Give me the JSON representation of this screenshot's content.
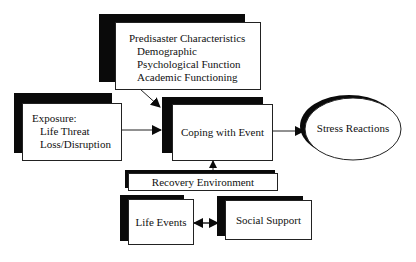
{
  "diagram": {
    "nodes": {
      "predisaster": {
        "title": "Predisaster Characteristics",
        "items": [
          "Demographic",
          "Psychological Function",
          "Academic Functioning"
        ]
      },
      "exposure": {
        "title": "Exposure:",
        "items": [
          "Life Threat",
          "Loss/Disruption"
        ]
      },
      "coping": {
        "label": "Coping with Event"
      },
      "stress": {
        "label": "Stress Reactions"
      },
      "recovery": {
        "label": "Recovery Environment"
      },
      "life_events": {
        "label": "Life Events"
      },
      "social_support": {
        "label": "Social Support"
      }
    },
    "edges": [
      {
        "from": "predisaster",
        "to": "coping",
        "type": "arrow"
      },
      {
        "from": "exposure",
        "to": "coping",
        "type": "arrow"
      },
      {
        "from": "coping",
        "to": "stress",
        "type": "arrow"
      },
      {
        "from": "recovery",
        "to": "coping",
        "type": "arrow"
      },
      {
        "from": "life_events",
        "to": "social_support",
        "type": "bidirectional"
      }
    ],
    "colors": {
      "shadow": "#0a0a0a",
      "box": "#ffffff",
      "line": "#222222"
    }
  }
}
